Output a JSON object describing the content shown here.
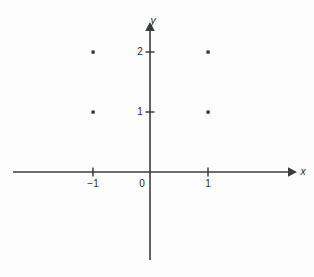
{
  "figure": {
    "title": "",
    "background_color": "#fdfdfd",
    "axis_color": "#3b3b3b",
    "point_color": "#2b2b2b",
    "width": 314,
    "height": 277
  },
  "axes": {
    "x_axis_name": "x",
    "y_axis_name": "y",
    "origin_label": "0"
  },
  "ticks": {
    "x": [
      {
        "value": -1,
        "label": "−1",
        "px": 93
      },
      {
        "value": 1,
        "label": "1",
        "px": 208
      }
    ],
    "y": [
      {
        "value": 1,
        "label": "1",
        "px": 112
      },
      {
        "value": 2,
        "label": "2",
        "px": 52
      }
    ]
  },
  "chart_data": {
    "type": "scatter",
    "title": "",
    "xlabel": "x",
    "ylabel": "y",
    "x": [
      -1,
      1,
      -1,
      1
    ],
    "y": [
      2,
      2,
      1,
      1
    ],
    "points": [
      {
        "x": -1,
        "y": 2,
        "px": 93,
        "py": 52
      },
      {
        "x": 1,
        "y": 2,
        "px": 208,
        "py": 52
      },
      {
        "x": -1,
        "y": 1,
        "px": 93,
        "py": 112
      },
      {
        "x": 1,
        "y": 1,
        "px": 208,
        "py": 112
      }
    ],
    "xticks": [
      -1,
      0,
      1
    ],
    "xtick_labels": [
      "−1",
      "0",
      "1"
    ],
    "yticks": [
      1,
      2
    ],
    "ytick_labels": [
      "1",
      "2"
    ],
    "xlim": [
      -2.4,
      2.4
    ],
    "ylim": [
      -1.5,
      2.45
    ],
    "grid": false,
    "legend": null,
    "marker": "square-dot",
    "marker_size": 3
  }
}
